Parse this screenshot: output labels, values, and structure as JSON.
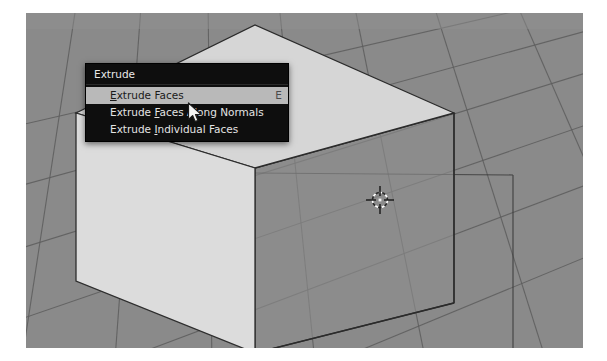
{
  "app": {
    "name": "blender-3d-viewport",
    "viewport_background": "#8a8a8a",
    "grid_color": "#5f5f5f"
  },
  "menu": {
    "name": "extrude-context-menu",
    "header": "Extrude",
    "background": "#0e0e0e",
    "highlight_color": "#b9b9b9",
    "items": [
      {
        "label": "Extrude Faces",
        "accel_before": "",
        "accel": "E",
        "accel_after": "xtrude Faces",
        "shortcut": "E",
        "highlighted": true
      },
      {
        "label": "Extrude Faces Along Normals",
        "accel_before": "Extrude ",
        "accel": "F",
        "accel_after": "aces Along Normals",
        "shortcut": "",
        "highlighted": false
      },
      {
        "label": "Extrude Individual Faces",
        "accel_before": "Extrude ",
        "accel": "I",
        "accel_after": "ndividual Faces",
        "shortcut": "",
        "highlighted": false
      }
    ]
  },
  "scene": {
    "object": "cube",
    "cube_left_face_color": "#d8d8d8",
    "cube_top_face_color": "#d2d2d2",
    "cube_front_face_color": "#898989",
    "cursor_3d_position": "380,200",
    "mouse_pointer_position": "191,106"
  }
}
